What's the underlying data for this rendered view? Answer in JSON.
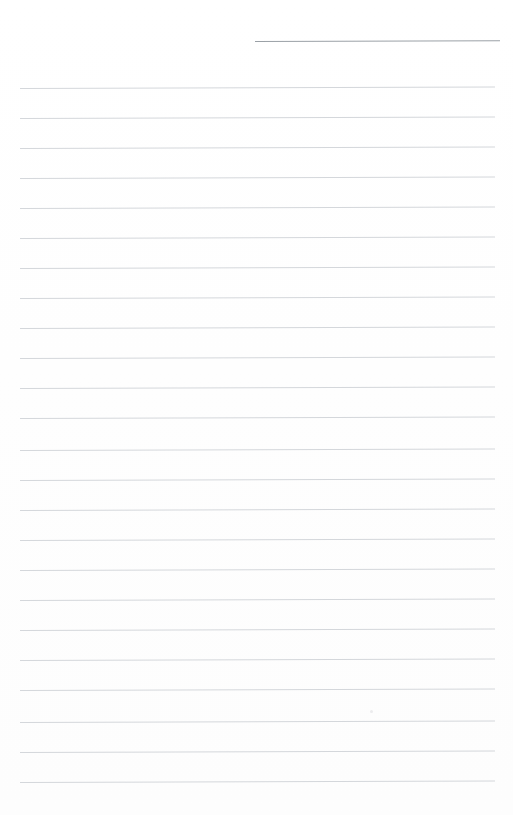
{
  "page": {
    "kind": "lined-notepad-page",
    "width": 513,
    "height": 815,
    "background_color": "#ffffff",
    "paper_tint": "#fdfdfd",
    "orientation": "portrait",
    "content_text": "",
    "is_blank": "true"
  },
  "date_rule": {
    "label": "",
    "placeholder": "",
    "x_start": 255,
    "x_end": 500,
    "y": 41,
    "length": 245,
    "thickness": 1,
    "color": "#9aa0a6",
    "skew_degrees": -0.2
  },
  "ruled_lines": {
    "count": 24,
    "first_y": 88,
    "spacing": 30,
    "x_start": 20,
    "x_end": 495,
    "length": 475,
    "thickness": 1,
    "color": "#d4d7db",
    "skew_degrees": -0.18,
    "y_positions": [
      88,
      118,
      148,
      178,
      208,
      238,
      268,
      298,
      328,
      358,
      388,
      418,
      450,
      480,
      510,
      540,
      570,
      600,
      630,
      660,
      690,
      722,
      752,
      782
    ]
  },
  "margins": {
    "left": 20,
    "right": 18,
    "top": 88,
    "bottom": 33
  },
  "artifacts": {
    "speck": {
      "x": 370,
      "y": 710,
      "color": "#ececee"
    }
  },
  "write_zones": {
    "count": 24,
    "placeholder": ""
  }
}
